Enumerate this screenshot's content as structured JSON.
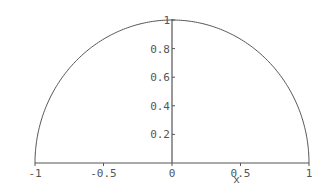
{
  "chart_data": {
    "type": "line",
    "title": "",
    "xlabel": "x",
    "ylabel": "",
    "xlim": [
      -1,
      1
    ],
    "ylim": [
      0,
      1
    ],
    "grid": false,
    "legend": null,
    "x_ticks": [
      {
        "value": -1,
        "label": "-1"
      },
      {
        "value": -0.5,
        "label": "-0.5"
      },
      {
        "value": 0,
        "label": "0"
      },
      {
        "value": 0.5,
        "label": "0.5"
      },
      {
        "value": 1,
        "label": "1"
      }
    ],
    "y_ticks": [
      {
        "value": 0.2,
        "label": "0.2"
      },
      {
        "value": 0.4,
        "label": "0.4"
      },
      {
        "value": 0.6,
        "label": "0.6"
      },
      {
        "value": 0.8,
        "label": "0.8"
      },
      {
        "value": 1,
        "label": "1"
      }
    ],
    "series": [
      {
        "name": "y = sqrt(1 - x^2)",
        "description": "upper semicircle of radius 1, closed with vertical segments at x=-1 and x=1",
        "x": [
          -1,
          -0.9,
          -0.8,
          -0.7,
          -0.6,
          -0.5,
          -0.4,
          -0.3,
          -0.2,
          -0.1,
          0,
          0.1,
          0.2,
          0.3,
          0.4,
          0.5,
          0.6,
          0.7,
          0.8,
          0.9,
          1
        ],
        "y": [
          0,
          0.436,
          0.6,
          0.714,
          0.8,
          0.866,
          0.917,
          0.954,
          0.98,
          0.995,
          1,
          0.995,
          0.98,
          0.954,
          0.917,
          0.866,
          0.8,
          0.714,
          0.6,
          0.436,
          0
        ]
      }
    ]
  },
  "style": {
    "line_color": "#555555",
    "axis_color": "#555555",
    "background": "#ffffff"
  }
}
